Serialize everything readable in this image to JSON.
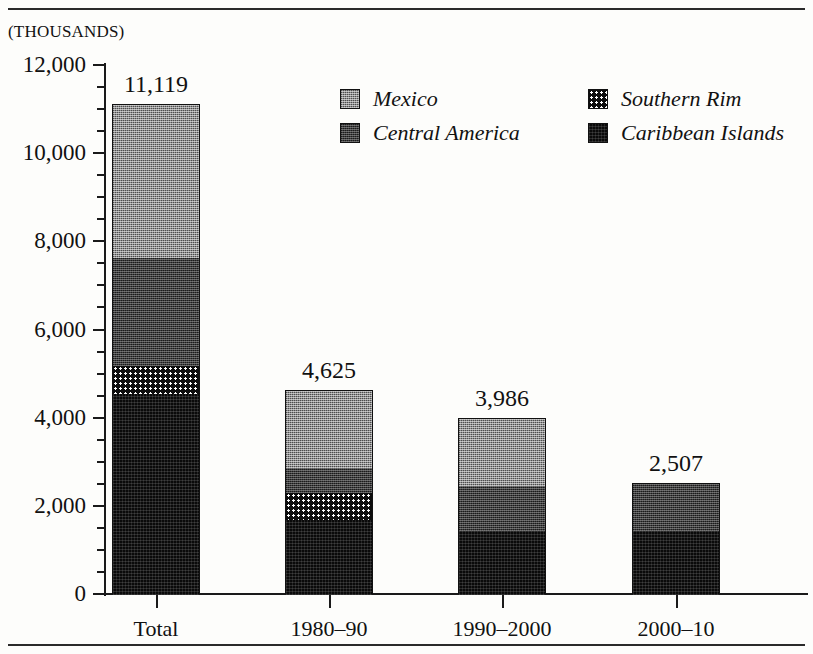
{
  "units_label": "(THOUSANDS)",
  "legend": {
    "items": [
      {
        "key": "mexico",
        "label": "Mexico",
        "swatch": "checker-mid-gray",
        "color": "#8d8d8d",
        "col": 0,
        "row": 0
      },
      {
        "key": "central",
        "label": "Central America",
        "swatch": "checker-dark-gray",
        "color": "#3b3b3b",
        "col": 0,
        "row": 1
      },
      {
        "key": "southern",
        "label": "Southern Rim",
        "swatch": "dotted-black",
        "color": "#0d0d0d",
        "col": 1,
        "row": 0
      },
      {
        "key": "caribbean",
        "label": "Caribbean Islands",
        "swatch": "solid-black",
        "color": "#0a0a0a",
        "col": 1,
        "row": 1
      }
    ]
  },
  "chart_data": {
    "type": "bar",
    "stacked": true,
    "title": "",
    "xlabel": "",
    "ylabel": "(THOUSANDS)",
    "ylim": [
      0,
      12000
    ],
    "ytick_step": 2000,
    "yminor_step": 500,
    "grid": false,
    "legend_position": "top-right-inside",
    "categories": [
      "Total",
      "1980–90",
      "1990–2000",
      "2000–10"
    ],
    "ytick_labels": [
      "0",
      "2,000",
      "4,000",
      "6,000",
      "8,000",
      "10,000",
      "12,000"
    ],
    "totals": [
      11119,
      4625,
      3986,
      2507
    ],
    "total_labels": [
      "11,119",
      "4,625",
      "3,986",
      "2,507"
    ],
    "series": [
      {
        "name": "Caribbean Islands",
        "values": [
          4570,
          1700,
          1450,
          1450
        ]
      },
      {
        "name": "Southern Rim",
        "values": [
          630,
          610,
          0,
          0
        ]
      },
      {
        "name": "Central America",
        "values": [
          2450,
          560,
          1020,
          1057
        ]
      },
      {
        "name": "Mexico",
        "values": [
          3469,
          1755,
          1516,
          0
        ]
      }
    ]
  }
}
